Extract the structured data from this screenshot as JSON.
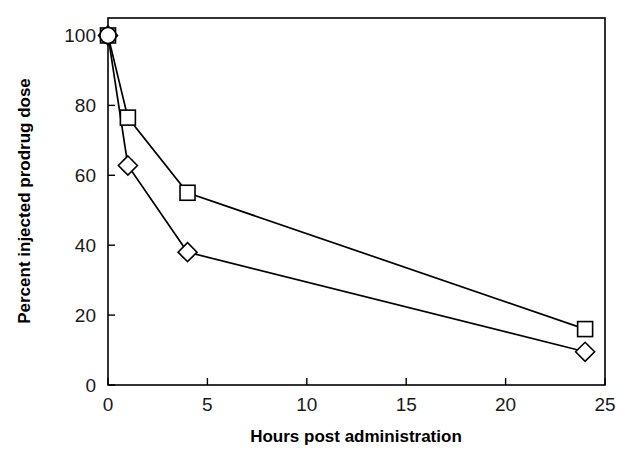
{
  "chart_data": {
    "type": "line",
    "title": "",
    "subtitle": "",
    "xlabel": "Hours post administration",
    "ylabel": "Percent injected prodrug dose",
    "xlim": [
      0,
      25
    ],
    "ylim": [
      0,
      105
    ],
    "xticks": [
      0,
      5,
      10,
      15,
      20,
      25
    ],
    "yticks": [
      0,
      20,
      40,
      60,
      80,
      100
    ],
    "xtick_labels": [
      "0",
      "5",
      "10",
      "15",
      "20",
      "25"
    ],
    "ytick_labels": [
      "0",
      "20",
      "40",
      "60",
      "80",
      "100"
    ],
    "grid": false,
    "legend": "none",
    "frame": "box",
    "tick_direction": "in",
    "x": [
      0,
      1,
      4,
      24
    ],
    "series": [
      {
        "name": "Open squares",
        "marker": "square",
        "values": [
          100,
          76.5,
          55,
          16
        ],
        "errors": [
          0,
          1.5,
          2.0,
          0.8
        ]
      },
      {
        "name": "Open diamonds",
        "marker": "diamond",
        "values": [
          100,
          62.8,
          38,
          9.5
        ],
        "errors": [
          0,
          1.6,
          1.5,
          0.7
        ]
      }
    ],
    "origin_marker": "circle-square-diamond-overlap",
    "annotations": []
  },
  "axes": {
    "x_title": "Hours post administration",
    "y_title": "Percent injected prodrug dose"
  }
}
